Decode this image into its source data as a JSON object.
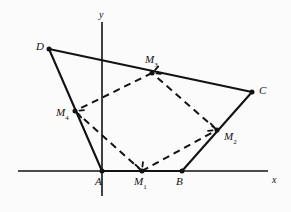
{
  "figure": {
    "kind": "geometry-diagram",
    "background_color": "#fbfbfb",
    "stroke_color": "#121212",
    "axes": {
      "x_axis": {
        "label": "x",
        "label_x": 272,
        "label_y": 175,
        "x1": 18,
        "y1": 171,
        "x2": 268,
        "y2": 171
      },
      "y_axis": {
        "label": "y",
        "label_x": 99,
        "label_y": 10,
        "x1": 102,
        "y1": 22,
        "x2": 102,
        "y2": 196
      }
    },
    "points": [
      {
        "id": "A",
        "label": "A",
        "sub": "",
        "x": 102,
        "y": 171,
        "label_x": 95,
        "label_y": 176,
        "dot": true
      },
      {
        "id": "B",
        "label": "B",
        "sub": "",
        "x": 182,
        "y": 171,
        "label_x": 176,
        "label_y": 176,
        "dot": true
      },
      {
        "id": "C",
        "label": "C",
        "sub": "",
        "x": 252,
        "y": 92,
        "label_x": 259,
        "label_y": 85,
        "dot": true
      },
      {
        "id": "D",
        "label": "D",
        "sub": "",
        "x": 49,
        "y": 49,
        "label_x": 36,
        "label_y": 41,
        "dot": true
      },
      {
        "id": "M1",
        "label": "M",
        "sub": "1",
        "x": 142,
        "y": 171,
        "label_x": 134,
        "label_y": 176,
        "dot": true
      },
      {
        "id": "M2",
        "label": "M",
        "sub": "2",
        "x": 217,
        "y": 130,
        "label_x": 224,
        "label_y": 131,
        "dot": true
      },
      {
        "id": "M3",
        "label": "M",
        "sub": "3",
        "x": 152,
        "y": 73,
        "label_x": 145,
        "label_y": 54,
        "dot": true
      },
      {
        "id": "M4",
        "label": "M",
        "sub": "4",
        "x": 75,
        "y": 111,
        "label_x": 56,
        "label_y": 107,
        "dot": true
      }
    ],
    "solid_edges": [
      {
        "name": "side-AB",
        "from": "A",
        "to": "B"
      },
      {
        "name": "side-BC",
        "from": "B",
        "to": "C"
      },
      {
        "name": "side-CD",
        "from": "C",
        "to": "D"
      },
      {
        "name": "side-DA",
        "from": "D",
        "to": "A"
      }
    ],
    "dashed_edges": [
      {
        "name": "midseg-M1-M2",
        "from": "M1",
        "to": "M2"
      },
      {
        "name": "midseg-M2-M3",
        "from": "M2",
        "to": "M3"
      },
      {
        "name": "midseg-M3-M4",
        "from": "M3",
        "to": "M4"
      },
      {
        "name": "midseg-M4-M1",
        "from": "M4",
        "to": "M1"
      }
    ],
    "tick_marks": [
      {
        "name": "tick-M1",
        "x": 142,
        "y": 171,
        "angle": 250
      },
      {
        "name": "tick-M2",
        "x": 217,
        "y": 130,
        "angle": 200
      },
      {
        "name": "tick-M3",
        "x": 152,
        "y": 73,
        "angle": 340
      },
      {
        "name": "tick-M4",
        "x": 75,
        "y": 111,
        "angle": 20
      }
    ]
  }
}
